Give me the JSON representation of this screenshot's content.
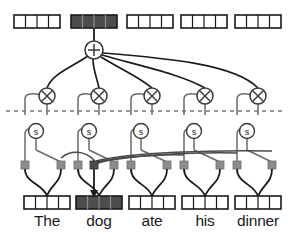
{
  "diagram": {
    "colors": {
      "line": "#1a1a1a",
      "node_stroke": "#555555",
      "node_fill": "#ffffff",
      "cell_empty": "#ffffff",
      "cell_filled": "#4d4d4d",
      "cell_filled_alt": "#5e5e5e",
      "box_border": "#1a1a1a",
      "dashed_line": "#7a7a7a",
      "terminal_square": "#8c8c8c",
      "terminal_square_dark": "#4d4d4d",
      "text": "#1a1a1a"
    },
    "tokens": [
      {
        "label": "The",
        "highlighted": false,
        "cells": 4,
        "x": 47
      },
      {
        "label": "dog",
        "highlighted": true,
        "cells": 4,
        "x": 99
      },
      {
        "label": "ate",
        "highlighted": false,
        "cells": 4,
        "x": 152
      },
      {
        "label": "his",
        "highlighted": false,
        "cells": 4,
        "x": 205
      },
      {
        "label": "dinner",
        "highlighted": false,
        "cells": 4,
        "x": 258
      }
    ],
    "top_vectors": [
      {
        "cells": 4,
        "highlighted": false,
        "x": 38
      },
      {
        "cells": 4,
        "highlighted": true,
        "x": 94
      },
      {
        "cells": 4,
        "highlighted": false,
        "x": 150
      },
      {
        "cells": 4,
        "highlighted": false,
        "x": 204
      },
      {
        "cells": 4,
        "highlighted": false,
        "x": 258
      }
    ],
    "sum_node": {
      "symbol": "+",
      "x": 94,
      "y": 50,
      "r": 9
    },
    "product_nodes": [
      {
        "symbol": "×",
        "x": 47,
        "y": 96,
        "r": 8
      },
      {
        "symbol": "×",
        "x": 99,
        "y": 96,
        "r": 8
      },
      {
        "symbol": "×",
        "x": 152,
        "y": 96,
        "r": 8
      },
      {
        "symbol": "×",
        "x": 205,
        "y": 96,
        "r": 8
      },
      {
        "symbol": "×",
        "x": 258,
        "y": 96,
        "r": 8
      }
    ],
    "softmax_nodes": [
      {
        "symbol": "s",
        "x": 36,
        "y": 131,
        "r": 7.5
      },
      {
        "symbol": "s",
        "x": 89,
        "y": 131,
        "r": 7.5
      },
      {
        "symbol": "s",
        "x": 141,
        "y": 131,
        "r": 7.5
      },
      {
        "symbol": "s",
        "x": 194,
        "y": 131,
        "r": 7.5
      },
      {
        "symbol": "s",
        "x": 247,
        "y": 131,
        "r": 7.5
      }
    ],
    "terminal_squares": [
      {
        "x": 25,
        "highlighted": false
      },
      {
        "x": 61,
        "highlighted": false
      },
      {
        "x": 78,
        "highlighted": false
      },
      {
        "x": 94,
        "highlighted": true
      },
      {
        "x": 114,
        "highlighted": false
      },
      {
        "x": 131,
        "highlighted": false
      },
      {
        "x": 167,
        "highlighted": false
      },
      {
        "x": 184,
        "highlighted": false
      },
      {
        "x": 220,
        "highlighted": false
      },
      {
        "x": 237,
        "highlighted": false
      },
      {
        "x": 272,
        "highlighted": false
      }
    ],
    "dashed_divider": {
      "y": 111,
      "dash": "4 4"
    }
  }
}
